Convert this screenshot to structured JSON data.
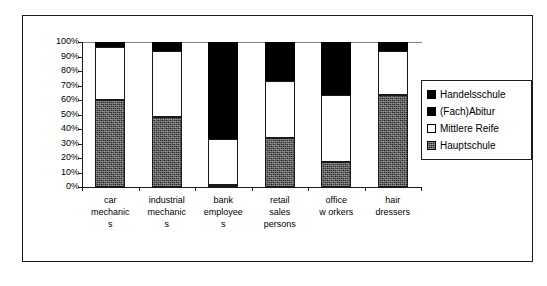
{
  "chart_data": {
    "type": "bar",
    "stacked": true,
    "normalized": true,
    "title": "",
    "subtitle": "",
    "xlabel": "",
    "ylabel": "",
    "ylim": [
      0,
      100
    ],
    "y_tick_labels": [
      "100%",
      "90%",
      "80%",
      "70%",
      "60%",
      "50%",
      "40%",
      "30%",
      "20%",
      "10%",
      "0%"
    ],
    "y_tick_values": [
      100,
      90,
      80,
      70,
      60,
      50,
      40,
      30,
      20,
      10,
      0
    ],
    "grid": false,
    "legend_position": "right",
    "categories": [
      "car mechanics",
      "industrial mechanics",
      "bank employees",
      "retail sales persons",
      "office workers",
      "hair dressers"
    ],
    "category_label_lines": [
      [
        "car",
        "mechanic",
        "s"
      ],
      [
        "industrial",
        "mechanic",
        "s"
      ],
      [
        "bank",
        "employee",
        "s"
      ],
      [
        "retail",
        "sales",
        "persons"
      ],
      [
        "office",
        "w orkers",
        ""
      ],
      [
        "hair",
        "dressers",
        ""
      ]
    ],
    "series": [
      {
        "name": "Hauptschule",
        "swatch": "texture",
        "color": "#2a2a2a",
        "values": [
          60,
          48,
          1.5,
          34,
          17,
          63.5
        ]
      },
      {
        "name": "Mittlere Reife",
        "swatch": "white",
        "color": "#ffffff",
        "values": [
          36.5,
          46,
          31.5,
          39,
          46.5,
          30.5
        ]
      },
      {
        "name": "(Fach)Abitur",
        "swatch": "black",
        "color": "#000000",
        "values": [
          3.5,
          6,
          67,
          27,
          36.5,
          6
        ]
      },
      {
        "name": "Handelsschule",
        "swatch": "black",
        "color": "#000000",
        "values": [
          0,
          0,
          0,
          0,
          0,
          0
        ]
      }
    ],
    "legend_entries": [
      {
        "label": "Handelsschule",
        "swatch": "black"
      },
      {
        "label": "(Fach)Abitur",
        "swatch": "black"
      },
      {
        "label": "Mittlere Reife",
        "swatch": "white"
      },
      {
        "label": "Hauptschule",
        "swatch": "texture"
      }
    ]
  }
}
